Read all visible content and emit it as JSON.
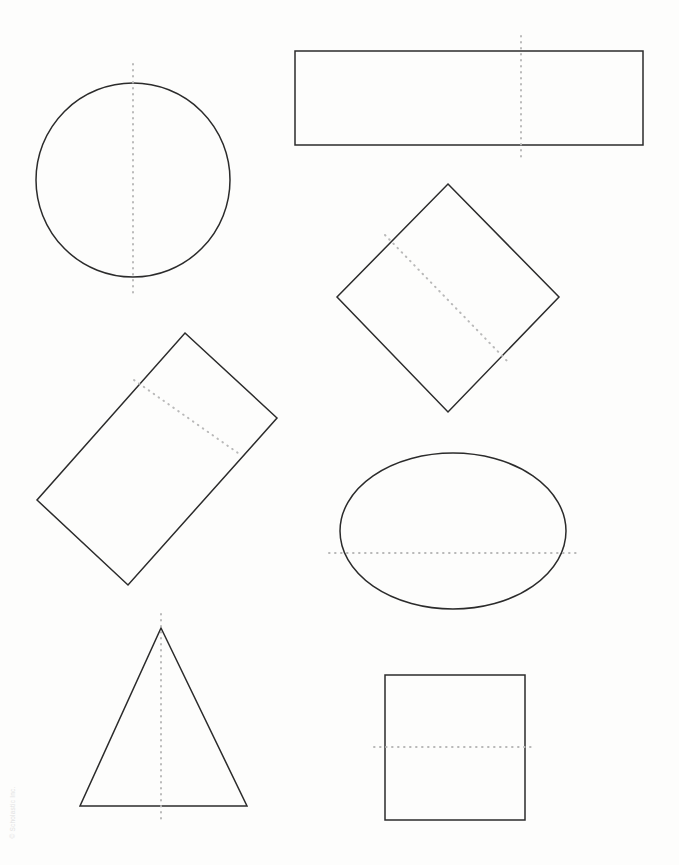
{
  "page": {
    "width": 679,
    "height": 865,
    "background_color": "#fdfdfc",
    "copyright": "© Scholastic Inc."
  },
  "style": {
    "outline_color": "#2b2b2b",
    "outline_width": 1.5,
    "symmetry_line_color": "#b9b9b9",
    "symmetry_line_width": 2,
    "symmetry_line_dash": "dotted"
  },
  "shapes": [
    {
      "id": "circle",
      "name": "circle",
      "label": "Circle",
      "geometry": {
        "type": "circle",
        "cx": 133,
        "cy": 180,
        "r": 97
      },
      "symmetry_line": {
        "orientation": "vertical",
        "x1": 133,
        "y1": 64,
        "x2": 133,
        "y2": 296
      }
    },
    {
      "id": "rectangle-wide",
      "name": "wide-rectangle",
      "label": "Rectangle",
      "geometry": {
        "type": "polygon",
        "points": "295,51 643,51 643,145 295,145"
      },
      "symmetry_line": {
        "orientation": "vertical",
        "x1": 521,
        "y1": 36,
        "x2": 521,
        "y2": 157
      }
    },
    {
      "id": "diamond",
      "name": "rotated-square-diamond",
      "label": "Square (rotated)",
      "geometry": {
        "type": "polygon",
        "points": "448,184 559,297 448,412 337,297"
      },
      "symmetry_line": {
        "orientation": "diagonal",
        "x1": 385,
        "y1": 235,
        "x2": 510,
        "y2": 364
      }
    },
    {
      "id": "rectangle-rotated",
      "name": "rotated-rectangle",
      "label": "Rectangle (rotated)",
      "geometry": {
        "type": "polygon",
        "points": "185,333 277,418 128,585 37,500"
      },
      "symmetry_line": {
        "orientation": "diagonal",
        "x1": 134,
        "y1": 380,
        "x2": 238,
        "y2": 453
      }
    },
    {
      "id": "ellipse",
      "name": "ellipse",
      "label": "Oval",
      "geometry": {
        "type": "ellipse",
        "cx": 453,
        "cy": 531,
        "rx": 113,
        "ry": 78
      },
      "symmetry_line": {
        "orientation": "horizontal",
        "x1": 329,
        "y1": 553,
        "x2": 579,
        "y2": 553
      }
    },
    {
      "id": "triangle",
      "name": "isosceles-triangle",
      "label": "Triangle",
      "geometry": {
        "type": "polygon",
        "points": "161,628 247,806 80,806"
      },
      "symmetry_line": {
        "orientation": "vertical",
        "x1": 161,
        "y1": 614,
        "x2": 161,
        "y2": 823
      }
    },
    {
      "id": "square",
      "name": "square",
      "label": "Square",
      "geometry": {
        "type": "polygon",
        "points": "385,675 525,675 525,820 385,820"
      },
      "symmetry_line": {
        "orientation": "horizontal",
        "x1": 374,
        "y1": 747,
        "x2": 533,
        "y2": 747
      }
    }
  ]
}
